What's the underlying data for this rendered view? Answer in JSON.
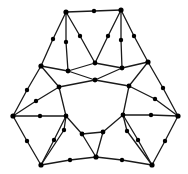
{
  "diagram": {
    "type": "planar-graph",
    "colors": {
      "edge": "#1a1a1a",
      "node": "#000000",
      "background": "#ffffff"
    },
    "nodes": [
      {
        "id": "A",
        "x": 66,
        "y": 12,
        "r": 2.6
      },
      {
        "id": "T",
        "x": 94,
        "y": 11,
        "r": 2.2
      },
      {
        "id": "B",
        "x": 121,
        "y": 10,
        "r": 2.6
      },
      {
        "id": "a1",
        "x": 53,
        "y": 39,
        "r": 2.2
      },
      {
        "id": "a2",
        "x": 66,
        "y": 42,
        "r": 2.2
      },
      {
        "id": "a3",
        "x": 80,
        "y": 36,
        "r": 2.2
      },
      {
        "id": "b1",
        "x": 108,
        "y": 36,
        "r": 2.2
      },
      {
        "id": "b2",
        "x": 121,
        "y": 40,
        "r": 2.2
      },
      {
        "id": "b3",
        "x": 134,
        "y": 36,
        "r": 2.2
      },
      {
        "id": "C",
        "x": 41,
        "y": 66,
        "r": 2.6
      },
      {
        "id": "D",
        "x": 68,
        "y": 71,
        "r": 2.4
      },
      {
        "id": "G",
        "x": 95,
        "y": 63,
        "r": 2.4
      },
      {
        "id": "F",
        "x": 122,
        "y": 68,
        "r": 2.4
      },
      {
        "id": "E",
        "x": 148,
        "y": 62,
        "r": 2.6
      },
      {
        "id": "H",
        "x": 95,
        "y": 80,
        "r": 2.4
      },
      {
        "id": "c1",
        "x": 27,
        "y": 90,
        "r": 2.2
      },
      {
        "id": "c2",
        "x": 36,
        "y": 101,
        "r": 2.2
      },
      {
        "id": "P",
        "x": 59,
        "y": 87,
        "r": 2.4
      },
      {
        "id": "Q",
        "x": 129,
        "y": 86,
        "r": 2.4
      },
      {
        "id": "e1",
        "x": 163,
        "y": 88,
        "r": 2.2
      },
      {
        "id": "e2",
        "x": 155,
        "y": 99,
        "r": 2.2
      },
      {
        "id": "L",
        "x": 13,
        "y": 116,
        "r": 2.6
      },
      {
        "id": "l1",
        "x": 40,
        "y": 116,
        "r": 2.2
      },
      {
        "id": "K",
        "x": 66,
        "y": 116,
        "r": 2.4
      },
      {
        "id": "h1",
        "x": 82,
        "y": 134,
        "r": 2.4
      },
      {
        "id": "h2",
        "x": 103,
        "y": 132,
        "r": 2.4
      },
      {
        "id": "N",
        "x": 123,
        "y": 115,
        "r": 2.4
      },
      {
        "id": "r1",
        "x": 151,
        "y": 115,
        "r": 2.2
      },
      {
        "id": "R",
        "x": 178,
        "y": 116,
        "r": 2.6
      },
      {
        "id": "d1",
        "x": 27,
        "y": 141,
        "r": 2.2
      },
      {
        "id": "d2",
        "x": 54,
        "y": 140,
        "r": 2.2
      },
      {
        "id": "d3",
        "x": 64,
        "y": 130,
        "r": 2.2
      },
      {
        "id": "f1",
        "x": 165,
        "y": 141,
        "r": 2.2
      },
      {
        "id": "f2",
        "x": 138,
        "y": 140,
        "r": 2.2
      },
      {
        "id": "f3",
        "x": 127,
        "y": 131,
        "r": 2.2
      },
      {
        "id": "LB",
        "x": 41,
        "y": 165,
        "r": 2.6
      },
      {
        "id": "m1",
        "x": 70,
        "y": 160,
        "r": 2.2
      },
      {
        "id": "BM",
        "x": 96,
        "y": 157,
        "r": 2.6
      },
      {
        "id": "m2",
        "x": 122,
        "y": 160,
        "r": 2.2
      },
      {
        "id": "RB",
        "x": 152,
        "y": 165,
        "r": 2.6
      }
    ],
    "edges": [
      [
        "A",
        "T"
      ],
      [
        "T",
        "B"
      ],
      [
        "A",
        "a1"
      ],
      [
        "a1",
        "C"
      ],
      [
        "A",
        "a2"
      ],
      [
        "a2",
        "D"
      ],
      [
        "A",
        "a3"
      ],
      [
        "a3",
        "G"
      ],
      [
        "B",
        "b1"
      ],
      [
        "b1",
        "G"
      ],
      [
        "B",
        "b2"
      ],
      [
        "b2",
        "F"
      ],
      [
        "B",
        "b3"
      ],
      [
        "b3",
        "E"
      ],
      [
        "C",
        "D"
      ],
      [
        "D",
        "G"
      ],
      [
        "G",
        "F"
      ],
      [
        "F",
        "E"
      ],
      [
        "D",
        "H"
      ],
      [
        "H",
        "F"
      ],
      [
        "C",
        "c1"
      ],
      [
        "c1",
        "L"
      ],
      [
        "C",
        "P"
      ],
      [
        "P",
        "c2"
      ],
      [
        "c2",
        "L"
      ],
      [
        "E",
        "e1"
      ],
      [
        "e1",
        "R"
      ],
      [
        "E",
        "Q"
      ],
      [
        "Q",
        "e2"
      ],
      [
        "e2",
        "R"
      ],
      [
        "H",
        "P"
      ],
      [
        "H",
        "Q"
      ],
      [
        "P",
        "K"
      ],
      [
        "Q",
        "N"
      ],
      [
        "L",
        "l1"
      ],
      [
        "l1",
        "K"
      ],
      [
        "R",
        "r1"
      ],
      [
        "r1",
        "N"
      ],
      [
        "K",
        "h1"
      ],
      [
        "N",
        "h2"
      ],
      [
        "h1",
        "h2"
      ],
      [
        "L",
        "d1"
      ],
      [
        "d1",
        "LB"
      ],
      [
        "K",
        "d2"
      ],
      [
        "d2",
        "LB"
      ],
      [
        "K",
        "d3"
      ],
      [
        "d3",
        "LB"
      ],
      [
        "R",
        "f1"
      ],
      [
        "f1",
        "RB"
      ],
      [
        "N",
        "f2"
      ],
      [
        "f2",
        "RB"
      ],
      [
        "N",
        "f3"
      ],
      [
        "f3",
        "RB"
      ],
      [
        "h1",
        "BM"
      ],
      [
        "h2",
        "BM"
      ],
      [
        "LB",
        "m1"
      ],
      [
        "m1",
        "BM"
      ],
      [
        "BM",
        "m2"
      ],
      [
        "m2",
        "RB"
      ]
    ]
  }
}
